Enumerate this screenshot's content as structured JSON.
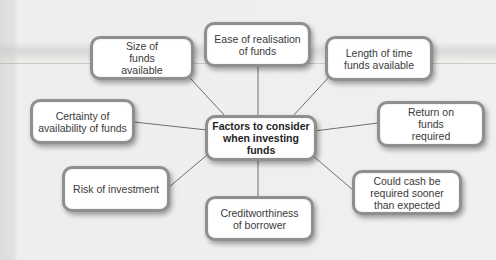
{
  "diagram": {
    "type": "mind-map",
    "center": {
      "label": "Factors to consider when investing funds"
    },
    "nodes": [
      {
        "id": "ease",
        "label": "Ease of realisation of funds"
      },
      {
        "id": "size",
        "label": "Size of funds available"
      },
      {
        "id": "length",
        "label": "Length of time funds available"
      },
      {
        "id": "certainty",
        "label": "Certainty of availability of funds"
      },
      {
        "id": "return",
        "label": "Return on funds required"
      },
      {
        "id": "risk",
        "label": "Risk of investment"
      },
      {
        "id": "cash",
        "label": "Could cash be required sooner than expected"
      },
      {
        "id": "credit",
        "label": "Creditworthiness of borrower"
      }
    ],
    "colors": {
      "node_border": "#8f8f8d",
      "node_fill": "#ffffff",
      "connector": "#6e6e6c",
      "background": "#f0f0ee"
    }
  }
}
